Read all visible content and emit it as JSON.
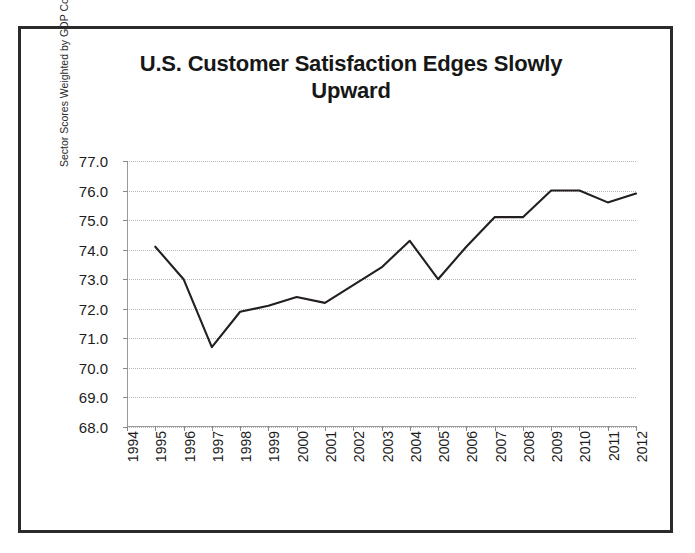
{
  "figure": {
    "title": "U.S. Customer Satisfaction Edges Slowly Upward",
    "title_line1": "U.S. Customer Satisfaction Edges Slowly",
    "title_line2": "Upward",
    "line_color": "#231f20",
    "gridline_color": "#b9b9b9",
    "frame_color": "#2b2b2b",
    "background": "#ffffff"
  },
  "chart_data": {
    "type": "line",
    "title": "U.S. Customer Satisfaction Edges Slowly Upward",
    "xlabel": "",
    "ylabel": "Sector Scores Weighted by GDP Contribution",
    "ylim": [
      68.0,
      77.0
    ],
    "ytick_step": 1.0,
    "ytick_labels": [
      "77.0",
      "76.0",
      "75.0",
      "74.0",
      "73.0",
      "72.0",
      "71.0",
      "70.0",
      "69.0",
      "68.0"
    ],
    "ytick_values": [
      77.0,
      76.0,
      75.0,
      74.0,
      73.0,
      72.0,
      71.0,
      70.0,
      69.0,
      68.0
    ],
    "categories": [
      "1994",
      "1995",
      "1996",
      "1997",
      "1998",
      "1999",
      "2000",
      "2001",
      "2002",
      "2003",
      "2004",
      "2005",
      "2006",
      "2007",
      "2008",
      "2009",
      "2010",
      "2011",
      "2012"
    ],
    "x": [
      1994,
      1995,
      1996,
      1997,
      1998,
      1999,
      2000,
      2001,
      2002,
      2003,
      2004,
      2005,
      2006,
      2007,
      2008,
      2009,
      2010,
      2011,
      2012
    ],
    "values": [
      null,
      74.1,
      73.0,
      70.7,
      71.9,
      72.1,
      72.4,
      72.2,
      72.8,
      73.4,
      74.3,
      73.0,
      74.1,
      75.1,
      75.1,
      76.0,
      76.0,
      75.6,
      75.9
    ],
    "grid": true,
    "grid_axis": "y",
    "legend": false,
    "markers": false,
    "series": [
      {
        "name": "Sector Scores Weighted by GDP Contribution",
        "color": "#231f20",
        "values": [
          null,
          74.1,
          73.0,
          70.7,
          71.9,
          72.1,
          72.4,
          72.2,
          72.8,
          73.4,
          74.3,
          73.0,
          74.1,
          75.1,
          75.1,
          76.0,
          76.0,
          75.6,
          75.9
        ]
      }
    ]
  }
}
